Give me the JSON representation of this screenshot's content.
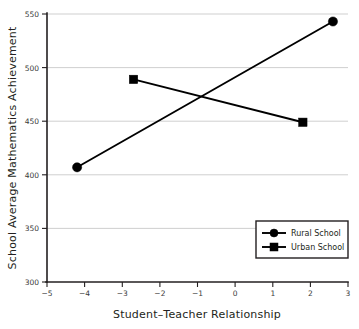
{
  "chart_data": {
    "type": "line",
    "title": "",
    "xlabel": "Student–Teacher Relationship",
    "ylabel": "School Average Mathematics Achievement",
    "xlim": [
      -5,
      3
    ],
    "ylim": [
      300,
      550
    ],
    "xticks": [
      -5,
      -4,
      -3,
      -2,
      -1,
      0,
      1,
      2,
      3
    ],
    "xtick_labels": [
      "−5",
      "−4",
      "−3",
      "−2",
      "−1",
      "0",
      "1",
      "2",
      "3"
    ],
    "yticks": [
      300,
      350,
      400,
      450,
      500,
      550
    ],
    "ytick_labels": [
      "300",
      "350",
      "400",
      "450",
      "500",
      "550"
    ],
    "grid": "horizontal",
    "legend_position": "lower-right",
    "series": [
      {
        "name": "Rural School",
        "marker": "circle",
        "x": [
          -4.2,
          2.6
        ],
        "y": [
          407,
          543
        ]
      },
      {
        "name": "Urban School",
        "marker": "square",
        "x": [
          -2.7,
          1.8
        ],
        "y": [
          489,
          449
        ]
      }
    ]
  },
  "legend": {
    "entries": [
      {
        "label": "Rural School",
        "marker": "circle"
      },
      {
        "label": "Urban School",
        "marker": "square"
      }
    ]
  },
  "colors": {
    "line": "#000000",
    "grid": "#c9c9c9",
    "axis": "#231f20",
    "text": "#231f20",
    "background": "#ffffff"
  }
}
